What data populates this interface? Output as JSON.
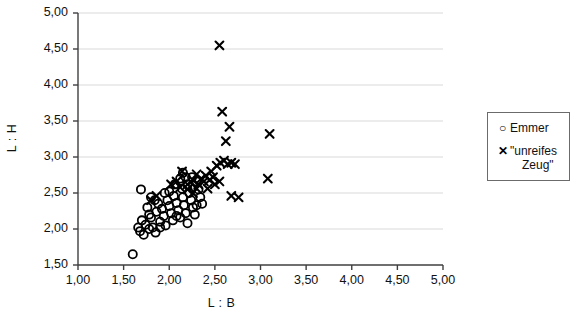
{
  "chart_data": {
    "type": "scatter",
    "title": "",
    "xlabel": "L : B",
    "ylabel": "L : H",
    "xlim": [
      1.0,
      5.0
    ],
    "ylim": [
      1.5,
      5.0
    ],
    "xticks": [
      "1,00",
      "1,50",
      "2,00",
      "2,50",
      "3,00",
      "3,50",
      "4,00",
      "4,50",
      "5,00"
    ],
    "xtick_values": [
      1.0,
      1.5,
      2.0,
      2.5,
      3.0,
      3.5,
      4.0,
      4.5,
      5.0
    ],
    "yticks": [
      "1,50",
      "2,00",
      "2,50",
      "3,00",
      "3,50",
      "4,00",
      "4,50",
      "5,00"
    ],
    "ytick_values": [
      1.5,
      2.0,
      2.5,
      3.0,
      3.5,
      4.0,
      4.5,
      5.0
    ],
    "grid": "horizontal",
    "grid_color": "#d9d9d9",
    "axis_color": "#3f3f3f",
    "marker_color": "#000000",
    "legend_position": "right",
    "decimal_separator": "comma",
    "series": [
      {
        "name": "Emmer",
        "marker": "circle-open",
        "points": [
          [
            1.6,
            1.65
          ],
          [
            1.69,
            2.55
          ],
          [
            1.7,
            2.12
          ],
          [
            1.68,
            1.97
          ],
          [
            1.72,
            1.92
          ],
          [
            1.66,
            2.02
          ],
          [
            1.74,
            2.06
          ],
          [
            1.78,
            2.2
          ],
          [
            1.76,
            2.3
          ],
          [
            1.8,
            2.16
          ],
          [
            1.82,
            2.02
          ],
          [
            1.85,
            1.95
          ],
          [
            1.86,
            2.24
          ],
          [
            1.88,
            2.35
          ],
          [
            1.9,
            2.1
          ],
          [
            1.92,
            2.28
          ],
          [
            1.94,
            2.18
          ],
          [
            1.96,
            2.05
          ],
          [
            1.98,
            2.4
          ],
          [
            2.0,
            2.32
          ],
          [
            2.02,
            2.22
          ],
          [
            2.04,
            2.12
          ],
          [
            2.05,
            2.46
          ],
          [
            2.08,
            2.36
          ],
          [
            2.1,
            2.26
          ],
          [
            2.12,
            2.16
          ],
          [
            2.14,
            2.56
          ],
          [
            2.15,
            2.44
          ],
          [
            2.16,
            2.33
          ],
          [
            2.18,
            2.22
          ],
          [
            2.12,
            2.7
          ],
          [
            2.15,
            2.78
          ],
          [
            2.2,
            2.62
          ],
          [
            2.22,
            2.5
          ],
          [
            2.24,
            2.4
          ],
          [
            2.26,
            2.3
          ],
          [
            2.28,
            2.2
          ],
          [
            2.3,
            2.66
          ],
          [
            2.32,
            2.55
          ],
          [
            2.34,
            2.44
          ],
          [
            2.3,
            2.33
          ],
          [
            2.2,
            2.08
          ],
          [
            1.84,
            2.4
          ],
          [
            1.8,
            2.44
          ],
          [
            2.06,
            2.62
          ],
          [
            2.18,
            2.72
          ],
          [
            2.25,
            2.72
          ],
          [
            1.95,
            2.5
          ],
          [
            2.0,
            2.52
          ],
          [
            2.08,
            2.18
          ],
          [
            1.9,
            2.02
          ],
          [
            1.78,
            2.0
          ],
          [
            2.36,
            2.35
          ]
        ]
      },
      {
        "name": "\"unreifes Zeug\"",
        "marker": "x",
        "points": [
          [
            2.55,
            4.55
          ],
          [
            2.58,
            3.63
          ],
          [
            2.66,
            3.42
          ],
          [
            2.62,
            3.22
          ],
          [
            3.1,
            3.32
          ],
          [
            2.56,
            2.92
          ],
          [
            2.6,
            2.95
          ],
          [
            2.64,
            2.9
          ],
          [
            2.68,
            2.92
          ],
          [
            2.72,
            2.9
          ],
          [
            2.52,
            2.88
          ],
          [
            2.46,
            2.8
          ],
          [
            2.4,
            2.74
          ],
          [
            2.35,
            2.7
          ],
          [
            2.3,
            2.76
          ],
          [
            2.26,
            2.68
          ],
          [
            2.2,
            2.62
          ],
          [
            2.14,
            2.8
          ],
          [
            2.32,
            2.62
          ],
          [
            2.38,
            2.66
          ],
          [
            2.44,
            2.68
          ],
          [
            2.5,
            2.62
          ],
          [
            2.55,
            2.66
          ],
          [
            2.3,
            2.56
          ],
          [
            2.26,
            2.5
          ],
          [
            2.2,
            2.55
          ],
          [
            2.12,
            2.58
          ],
          [
            1.86,
            2.46
          ],
          [
            1.8,
            2.4
          ],
          [
            2.08,
            2.66
          ],
          [
            2.02,
            2.62
          ],
          [
            2.68,
            2.46
          ],
          [
            2.76,
            2.44
          ],
          [
            3.08,
            2.7
          ],
          [
            2.42,
            2.56
          ],
          [
            2.48,
            2.72
          ]
        ]
      }
    ]
  },
  "legend": {
    "title": "",
    "entries": [
      {
        "marker_glyph": "○",
        "label": "Emmer"
      },
      {
        "marker_glyph": "✕",
        "label": "\"unreifes",
        "label_line2": "Zeug\""
      }
    ]
  }
}
